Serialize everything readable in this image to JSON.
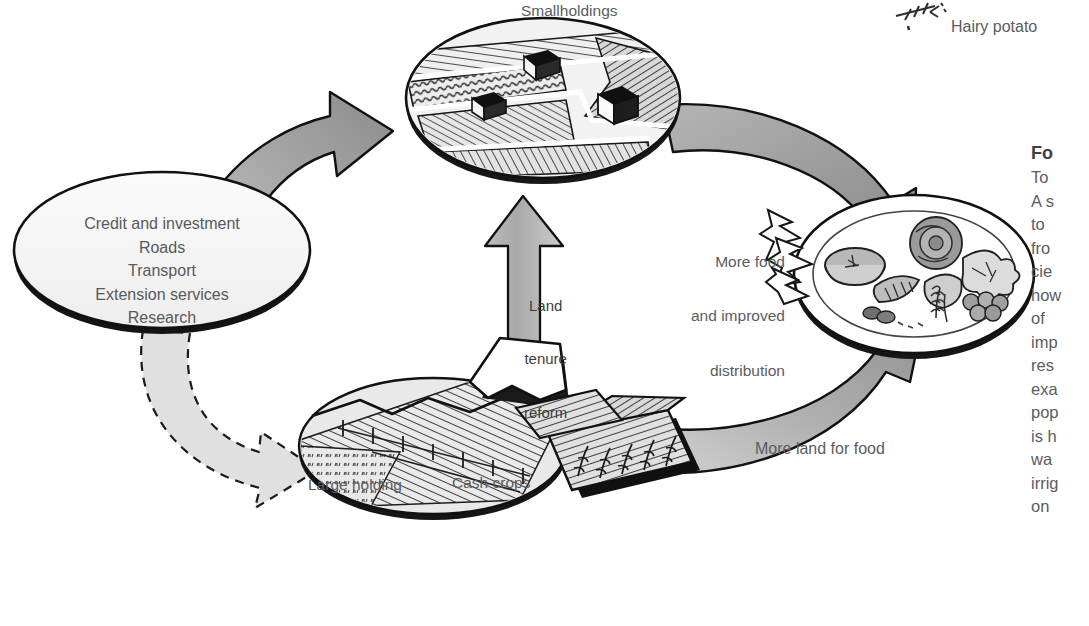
{
  "figure": {
    "domain": "diagram",
    "background_color": "#ffffff",
    "ink_color": "#1a1a1a",
    "text_color": "#5b5c5e",
    "arrow_fill_light": "#d8d8d8",
    "arrow_fill_mid": "#a9a9a9",
    "arrow_fill_dark": "#8e8e8e"
  },
  "labels": {
    "smallholdings": "Smallholdings",
    "hairy_potato": "Hairy potato",
    "large_holding": "Large holding",
    "cash_crops": "Cash crops",
    "more_land_for_food": "More land for food",
    "more_food_line1": "More food",
    "more_food_line2": "and improved",
    "more_food_line3": "distribution",
    "land_tenure_line1": "Land",
    "land_tenure_line2": "tenure",
    "land_tenure_line3": "reform"
  },
  "inputs_ellipse": {
    "items": [
      "Credit and investment",
      "Roads",
      "Transport",
      "Extension services",
      "Research"
    ]
  },
  "side_column": {
    "heading": "Fo",
    "lines": [
      "To",
      "A s",
      "to ",
      "fro",
      "cie",
      "how",
      "of ",
      "imp",
      "res",
      "exa",
      "pop",
      "is h",
      "wa",
      "irrig",
      "on"
    ]
  }
}
